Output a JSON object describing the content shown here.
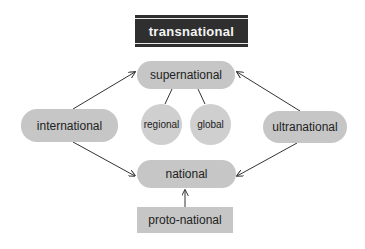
{
  "diagram": {
    "nodes": {
      "transnational": {
        "label": "transnational",
        "shape": "dark-rectangle"
      },
      "supernational": {
        "label": "supernational",
        "shape": "pill"
      },
      "regional": {
        "label": "regional",
        "shape": "circle"
      },
      "global": {
        "label": "global",
        "shape": "circle"
      },
      "international": {
        "label": "international",
        "shape": "pill"
      },
      "ultranational": {
        "label": "ultranational",
        "shape": "pill"
      },
      "national": {
        "label": "national",
        "shape": "pill"
      },
      "proto_national": {
        "label": "proto-national",
        "shape": "rectangle"
      }
    },
    "edges": [
      {
        "from": "international",
        "to": "supernational",
        "arrow": true
      },
      {
        "from": "ultranational",
        "to": "supernational",
        "arrow": true
      },
      {
        "from": "international",
        "to": "national",
        "arrow": true
      },
      {
        "from": "ultranational",
        "to": "national",
        "arrow": true
      },
      {
        "from": "proto-national",
        "to": "national",
        "arrow": true
      },
      {
        "from": "supernational",
        "to": "regional",
        "arrow": false
      },
      {
        "from": "supernational",
        "to": "global",
        "arrow": false
      }
    ],
    "colors": {
      "dark_fill": "#2f2f2f",
      "node_fill": "#c6c6c6",
      "circle_fill": "#cfcfcf",
      "line": "#333333"
    }
  }
}
